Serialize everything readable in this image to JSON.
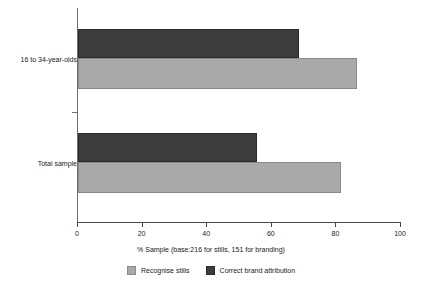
{
  "chart_data": {
    "type": "bar",
    "orientation": "horizontal",
    "title": "",
    "xlabel": "% Sample (base:216 for stills, 151 for branding)",
    "ylabel": "",
    "categories": [
      "16 to 34-year-olds",
      "Total sample"
    ],
    "series": [
      {
        "name": "Recognise stills",
        "values": [
          86,
          81
        ],
        "color": "#a9a9a9"
      },
      {
        "name": "Correct brand attribution",
        "values": [
          68,
          55
        ],
        "color": "#3c3c3c"
      }
    ],
    "xlim": [
      0,
      100
    ],
    "xticks": [
      0,
      20,
      40,
      60,
      80,
      100
    ],
    "xtick_labels": [
      "0",
      "20",
      "40",
      "60",
      "80",
      "100"
    ],
    "grid": false,
    "legend_position": "bottom"
  },
  "axis": {
    "title": "% Sample (base:216 for stills, 151 for branding)",
    "ticks": [
      {
        "value": 0,
        "label": "0"
      },
      {
        "value": 20,
        "label": "20"
      },
      {
        "value": 40,
        "label": "40"
      },
      {
        "value": 60,
        "label": "60"
      },
      {
        "value": 80,
        "label": "80"
      },
      {
        "value": 100,
        "label": "100"
      }
    ]
  },
  "groups": [
    {
      "label": "16 to 34-year-olds",
      "bars": [
        {
          "series": "Correct brand attribution",
          "value": 68
        },
        {
          "series": "Recognise stills",
          "value": 86
        }
      ]
    },
    {
      "label": "Total sample",
      "bars": [
        {
          "series": "Correct brand attribution",
          "value": 55
        },
        {
          "series": "Recognise stills",
          "value": 81
        }
      ]
    }
  ],
  "legend": {
    "entries": [
      {
        "label": "Recognise stills",
        "swatch": "light-gray-swatch-icon"
      },
      {
        "label": "Correct brand attribution",
        "swatch": "dark-gray-swatch-icon"
      }
    ]
  }
}
